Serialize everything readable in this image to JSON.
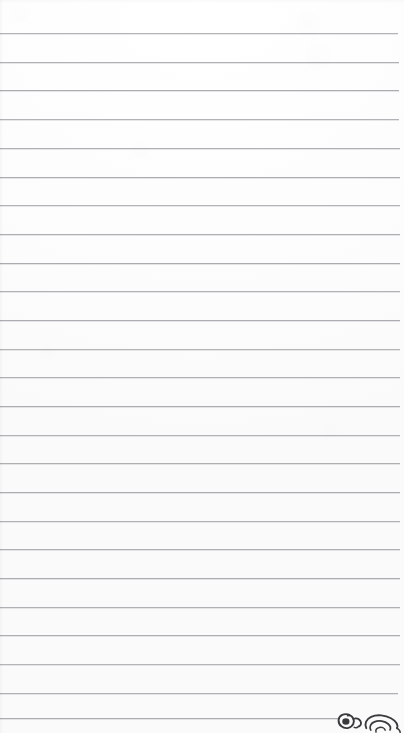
{
  "document": {
    "kind": "lined-notebook-paper-scan",
    "title": "Blank ruled notebook page",
    "page_width": 404,
    "page_height": 733,
    "background_color": "#fdfdfd",
    "written_text": "",
    "body_text_lines": []
  },
  "ruling": {
    "line_color": "#a9a9ad",
    "line_thickness": 1,
    "first_line_y": 33,
    "line_spacing": 28.7,
    "line_count": 25,
    "left_inset": 0,
    "right_inset": 4,
    "margin_rule": "none",
    "lines": [
      {
        "y": 33,
        "left": 0,
        "right_inset": 6
      },
      {
        "y": 62,
        "left": 0,
        "right_inset": 5
      },
      {
        "y": 90,
        "left": 0,
        "right_inset": 5
      },
      {
        "y": 119,
        "left": 0,
        "right_inset": 5
      },
      {
        "y": 148,
        "left": 0,
        "right_inset": 4
      },
      {
        "y": 177,
        "left": 0,
        "right_inset": 4
      },
      {
        "y": 205,
        "left": 0,
        "right_inset": 4
      },
      {
        "y": 234,
        "left": 0,
        "right_inset": 4
      },
      {
        "y": 263,
        "left": 0,
        "right_inset": 4
      },
      {
        "y": 291,
        "left": 0,
        "right_inset": 4
      },
      {
        "y": 320,
        "left": 0,
        "right_inset": 4
      },
      {
        "y": 349,
        "left": 0,
        "right_inset": 4
      },
      {
        "y": 377,
        "left": 0,
        "right_inset": 4
      },
      {
        "y": 406,
        "left": 0,
        "right_inset": 4
      },
      {
        "y": 435,
        "left": 0,
        "right_inset": 4
      },
      {
        "y": 463,
        "left": 0,
        "right_inset": 4
      },
      {
        "y": 492,
        "left": 0,
        "right_inset": 4
      },
      {
        "y": 521,
        "left": 0,
        "right_inset": 4
      },
      {
        "y": 549,
        "left": 0,
        "right_inset": 4
      },
      {
        "y": 578,
        "left": 0,
        "right_inset": 4
      },
      {
        "y": 607,
        "left": 0,
        "right_inset": 4
      },
      {
        "y": 635,
        "left": 0,
        "right_inset": 4
      },
      {
        "y": 664,
        "left": 0,
        "right_inset": 4
      },
      {
        "y": 693,
        "left": 0,
        "right_inset": 6
      },
      {
        "y": 718,
        "left": 0,
        "right_inset": 64
      }
    ]
  },
  "annotation": {
    "label": "handwriting-doodle",
    "description": "Small dark ink cursive doodle clipped by the bottom-right page edge",
    "ink_color": "#3a3a3e",
    "x": 334,
    "y": 706,
    "width": 70,
    "height": 27
  }
}
